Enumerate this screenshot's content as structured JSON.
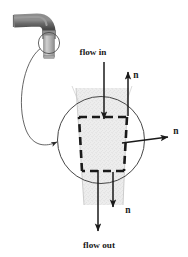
{
  "figure": {
    "labels": {
      "flow_in": "flow in",
      "flow_out": "flow out",
      "normal_top": "n",
      "normal_right": "n",
      "normal_bottom": "n"
    },
    "icons": {
      "faucet": "faucet-icon",
      "water_stream": "water-stream-icon",
      "magnifier_circle": "magnifier-circle-icon",
      "callout_leader": "callout-leader-icon",
      "control_volume": "dashed-control-volume-icon",
      "arrow_flow_in": "down-arrow-icon",
      "arrow_flow_out": "down-arrow-icon",
      "arrow_normal_top": "up-arrow-icon",
      "arrow_normal_right": "right-arrow-icon",
      "arrow_normal_bottom": "down-arrow-icon"
    },
    "colors": {
      "background": "#ffffff",
      "line": "#1a1a1a",
      "faucet_dark": "#4a4a4a",
      "faucet_light": "#bdbdbd",
      "stream_fill": "#e8e8e8",
      "stream_edge": "#b5b5b5",
      "thin_line": "#555555"
    }
  }
}
